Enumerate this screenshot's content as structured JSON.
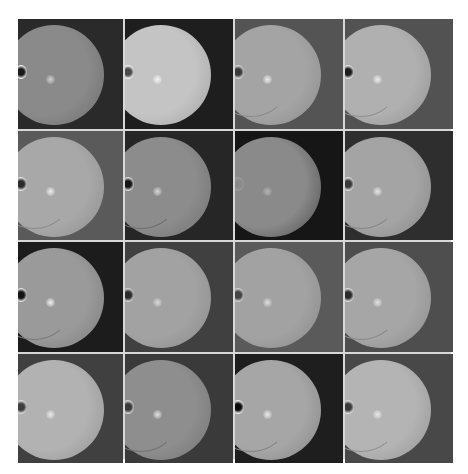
{
  "figure": {
    "rows": 4,
    "cols": 4,
    "cells": [
      {
        "bg": "#2a2a2a",
        "fundus": "#8a8a8a",
        "edge": "#6c6c6c",
        "disc": "#e8e8e8",
        "disc_core": "#1a1a1a",
        "macula": "#d0d0d0",
        "vessels": false
      },
      {
        "bg": "#1e1e1e",
        "fundus": "#c4c4c4",
        "edge": "#a0a0a0",
        "disc": "#f0f0f0",
        "disc_core": "#4a4a4a",
        "macula": "#f4f4f4",
        "vessels": false
      },
      {
        "bg": "#545454",
        "fundus": "#a4a4a4",
        "edge": "#8a8a8a",
        "disc": "#d8d8d8",
        "disc_core": "#3a3a3a",
        "macula": "#ececec",
        "vessels": true
      },
      {
        "bg": "#525252",
        "fundus": "#b0b0b0",
        "edge": "#909090",
        "disc": "#e4e4e4",
        "disc_core": "#1c1c1c",
        "macula": "#ececec",
        "vessels": true
      },
      {
        "bg": "#5a5a5a",
        "fundus": "#a8a8a8",
        "edge": "#8c8c8c",
        "disc": "#e0e0e0",
        "disc_core": "#2a2a2a",
        "macula": "#ececec",
        "vessels": true
      },
      {
        "bg": "#262626",
        "fundus": "#8c8c8c",
        "edge": "#6e6e6e",
        "disc": "#dcdcdc",
        "disc_core": "#141414",
        "macula": "#d6d6d6",
        "vessels": true
      },
      {
        "bg": "#161616",
        "fundus": "#8a8a8a",
        "edge": "#4a4a4a",
        "disc": "#9a9a9a",
        "disc_core": "#8a8a8a",
        "macula": "#b4b4b4",
        "vessels": false
      },
      {
        "bg": "#2e2e2e",
        "fundus": "#a4a4a4",
        "edge": "#868686",
        "disc": "#dadada",
        "disc_core": "#3a3a3a",
        "macula": "#e6e6e6",
        "vessels": true
      },
      {
        "bg": "#1c1c1c",
        "fundus": "#9a9a9a",
        "edge": "#7a7a7a",
        "disc": "#e0e0e0",
        "disc_core": "#141414",
        "macula": "#f0f0f0",
        "vessels": true
      },
      {
        "bg": "#404040",
        "fundus": "#a2a2a2",
        "edge": "#888888",
        "disc": "#d2d2d2",
        "disc_core": "#2c2c2c",
        "macula": "#d8d8d8",
        "vessels": false
      },
      {
        "bg": "#5a5a5a",
        "fundus": "#a2a2a2",
        "edge": "#888888",
        "disc": "#d0d0d0",
        "disc_core": "#444444",
        "macula": "#dcdcdc",
        "vessels": false
      },
      {
        "bg": "#4e4e4e",
        "fundus": "#a6a6a6",
        "edge": "#8a8a8a",
        "disc": "#dcdcdc",
        "disc_core": "#2a2a2a",
        "macula": "#e2e2e2",
        "vessels": true
      },
      {
        "bg": "#404040",
        "fundus": "#b2b2b2",
        "edge": "#929292",
        "disc": "#dadada",
        "disc_core": "#3c3c3c",
        "macula": "#e8e8e8",
        "vessels": false
      },
      {
        "bg": "#3a3a3a",
        "fundus": "#8e8e8e",
        "edge": "#727272",
        "disc": "#d6d6d6",
        "disc_core": "#3a3a3a",
        "macula": "#e2e2e2",
        "vessels": true
      },
      {
        "bg": "#1e1e1e",
        "fundus": "#a6a6a6",
        "edge": "#848484",
        "disc": "#eeeeee",
        "disc_core": "#0a0a0a",
        "macula": "#eaeaea",
        "vessels": true
      },
      {
        "bg": "#484848",
        "fundus": "#b4b4b4",
        "edge": "#929292",
        "disc": "#dedede",
        "disc_core": "#3a3a3a",
        "macula": "#e8e8e8",
        "vessels": true
      }
    ]
  }
}
